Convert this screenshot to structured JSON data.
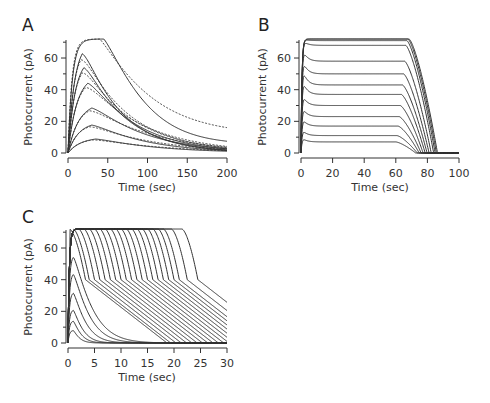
{
  "chart_data": [
    {
      "panel": "A",
      "type": "line",
      "title": "",
      "xlabel": "Time (sec)",
      "ylabel": "Photocurrent (pA)",
      "xlim": [
        0,
        200
      ],
      "ylim": [
        0,
        72
      ],
      "xticks": [
        0,
        50,
        100,
        150,
        200
      ],
      "yticks": [
        0,
        20,
        40,
        60
      ],
      "grid": false,
      "legend": null,
      "series_style": "solid = recorded, dotted = model fit",
      "series": [
        {
          "name": "trace 1",
          "peak": 72,
          "peak_time": 12,
          "tail_200": 18,
          "fit_tail_200": 22
        },
        {
          "name": "trace 2",
          "peak": 64,
          "peak_time": 18,
          "tail_200": 4,
          "fit_tail_200": 5
        },
        {
          "name": "trace 3",
          "peak": 55,
          "peak_time": 20,
          "tail_200": 3,
          "fit_tail_200": 4
        },
        {
          "name": "trace 4",
          "peak": 45,
          "peak_time": 25,
          "tail_200": 2,
          "fit_tail_200": 3
        },
        {
          "name": "trace 5",
          "peak": 29,
          "peak_time": 30,
          "tail_200": 1.5,
          "fit_tail_200": 2
        },
        {
          "name": "trace 6",
          "peak": 18,
          "peak_time": 30,
          "tail_200": 1,
          "fit_tail_200": 1.5
        },
        {
          "name": "trace 7",
          "peak": 9,
          "peak_time": 35,
          "tail_200": 0.5,
          "fit_tail_200": 1
        }
      ]
    },
    {
      "panel": "B",
      "type": "line",
      "title": "",
      "xlabel": "Time (sec)",
      "ylabel": "Photocurrent (pA)",
      "xlim": [
        0,
        100
      ],
      "ylim": [
        0,
        72
      ],
      "xticks": [
        0,
        20,
        40,
        60,
        80,
        100
      ],
      "yticks": [
        0,
        20,
        40,
        60
      ],
      "grid": false,
      "legend": null,
      "series": [
        {
          "name": "s1",
          "steady": 7,
          "overshoot": 9,
          "off_time": 60
        },
        {
          "name": "s2",
          "steady": 11,
          "overshoot": 14,
          "off_time": 60.7
        },
        {
          "name": "s3",
          "steady": 17,
          "overshoot": 21,
          "off_time": 61.4
        },
        {
          "name": "s4",
          "steady": 23,
          "overshoot": 28,
          "off_time": 62.1
        },
        {
          "name": "s5",
          "steady": 30,
          "overshoot": 36,
          "off_time": 62.8
        },
        {
          "name": "s6",
          "steady": 37,
          "overshoot": 45,
          "off_time": 63.5
        },
        {
          "name": "s7",
          "steady": 43,
          "overshoot": 52,
          "off_time": 64.2
        },
        {
          "name": "s8",
          "steady": 50,
          "overshoot": 58,
          "off_time": 64.9
        },
        {
          "name": "s9",
          "steady": 58,
          "overshoot": 65,
          "off_time": 65.6
        },
        {
          "name": "s10",
          "steady": 68,
          "overshoot": 71,
          "off_time": 66.3
        },
        {
          "name": "s11",
          "steady": 71,
          "overshoot": 72,
          "off_time": 67
        },
        {
          "name": "s12",
          "steady": 72,
          "overshoot": 72,
          "off_time": 67.7
        },
        {
          "name": "s13",
          "steady": 72,
          "overshoot": 72,
          "off_time": 68.4
        }
      ]
    },
    {
      "panel": "C",
      "type": "line",
      "title": "",
      "xlabel": "Time (sec)",
      "ylabel": "Photocurrent (pA)",
      "xlim": [
        0,
        30
      ],
      "ylim": [
        0,
        72
      ],
      "xticks": [
        0,
        5,
        10,
        15,
        20,
        25,
        30
      ],
      "yticks": [
        0,
        20,
        40,
        60
      ],
      "grid": false,
      "legend": null,
      "series": [
        {
          "name": "c1",
          "peak": 8,
          "plateau_end": 0
        },
        {
          "name": "c2",
          "peak": 14,
          "plateau_end": 0
        },
        {
          "name": "c3",
          "peak": 21,
          "plateau_end": 0
        },
        {
          "name": "c4",
          "peak": 32,
          "plateau_end": 0
        },
        {
          "name": "c5",
          "peak": 44,
          "plateau_end": 0
        },
        {
          "name": "c6",
          "peak": 55,
          "plateau_end": 0
        },
        {
          "name": "c7",
          "peak": 64,
          "plateau_end": 0.3
        },
        {
          "name": "c8",
          "peak": 69,
          "plateau_end": 1
        },
        {
          "name": "c9",
          "peak": 72,
          "plateau_end": 2
        },
        {
          "name": "c10",
          "peak": 72,
          "plateau_end": 3
        },
        {
          "name": "c11",
          "peak": 72,
          "plateau_end": 4
        },
        {
          "name": "c12",
          "peak": 72,
          "plateau_end": 5
        },
        {
          "name": "c13",
          "peak": 72,
          "plateau_end": 6
        },
        {
          "name": "c14",
          "peak": 72,
          "plateau_end": 7
        },
        {
          "name": "c15",
          "peak": 72,
          "plateau_end": 8
        },
        {
          "name": "c16",
          "peak": 72,
          "plateau_end": 9
        },
        {
          "name": "c17",
          "peak": 72,
          "plateau_end": 10
        },
        {
          "name": "c18",
          "peak": 72,
          "plateau_end": 11
        },
        {
          "name": "c19",
          "peak": 72,
          "plateau_end": 12
        },
        {
          "name": "c20",
          "peak": 72,
          "plateau_end": 13
        },
        {
          "name": "c21",
          "peak": 72,
          "plateau_end": 14
        },
        {
          "name": "c22",
          "peak": 72,
          "plateau_end": 15
        },
        {
          "name": "c23",
          "peak": 72,
          "plateau_end": 16
        },
        {
          "name": "c24",
          "peak": 72,
          "plateau_end": 17
        },
        {
          "name": "c25",
          "peak": 72,
          "plateau_end": 18
        },
        {
          "name": "c26",
          "peak": 72,
          "plateau_end": 19.5
        },
        {
          "name": "c27",
          "peak": 72,
          "plateau_end": 21.5
        }
      ]
    }
  ],
  "panels": {
    "A": {
      "letter": "A",
      "xlabel": "Time (sec)",
      "ylabel": "Photocurrent (pA)",
      "xticks": [
        "0",
        "50",
        "100",
        "150",
        "200"
      ],
      "yticks": [
        "0",
        "20",
        "40",
        "60"
      ]
    },
    "B": {
      "letter": "B",
      "xlabel": "Time (sec)",
      "ylabel": "Photocurrent (pA)",
      "xticks": [
        "0",
        "20",
        "40",
        "60",
        "80",
        "100"
      ],
      "yticks": [
        "0",
        "20",
        "40",
        "60"
      ]
    },
    "C": {
      "letter": "C",
      "xlabel": "Time (sec)",
      "ylabel": "Photocurrent (pA)",
      "xticks": [
        "0",
        "5",
        "10",
        "15",
        "20",
        "25",
        "30"
      ],
      "yticks": [
        "0",
        "20",
        "40",
        "60"
      ]
    }
  }
}
